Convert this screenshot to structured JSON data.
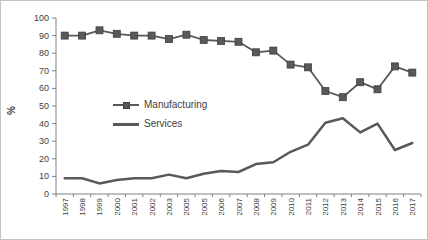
{
  "chart_data": {
    "type": "line",
    "title": "",
    "xlabel": "",
    "ylabel": "%",
    "ylim": [
      0,
      100
    ],
    "ytick_step": 10,
    "grid": false,
    "legend_position": "inside-center-left",
    "categories": [
      "1997",
      "1998",
      "1999",
      "2000",
      "2001",
      "2002",
      "2003",
      "2005",
      "2005",
      "2006",
      "2007",
      "2008",
      "2009",
      "2010",
      "2011",
      "2012",
      "2013",
      "2014",
      "2015",
      "2016",
      "2017"
    ],
    "series": [
      {
        "name": "Manufacturing",
        "marker": "square",
        "color": "#595959",
        "values": [
          90,
          90,
          93,
          91,
          90,
          90,
          88,
          90.5,
          87.5,
          87,
          86.5,
          80.5,
          81.5,
          73.5,
          72,
          58.5,
          55,
          63.5,
          59.5,
          72.5,
          69
        ]
      },
      {
        "name": "Services",
        "marker": "none",
        "color": "#595959",
        "values": [
          9,
          9,
          6,
          8,
          9,
          9,
          11,
          9,
          11.5,
          13,
          12.5,
          17,
          18,
          24,
          28,
          40.5,
          43,
          35,
          40,
          25,
          29
        ]
      }
    ],
    "colors": {
      "axis": "#808080",
      "tick_text": "#404040",
      "series": "#595959",
      "marker_border": "#3f3f3f"
    }
  }
}
